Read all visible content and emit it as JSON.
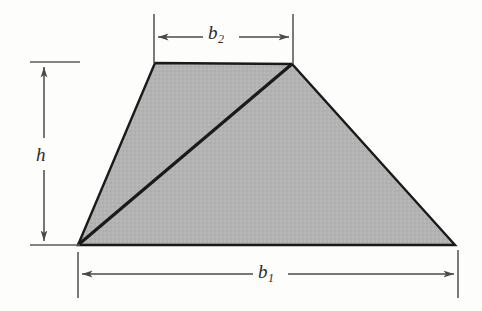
{
  "figure": {
    "kind": "geometry-diagram",
    "shape_name": "trapezoid",
    "background_color": "#fdfdfb",
    "fill_color": "#b3b3b3",
    "outline_color": "#1a1a1a",
    "dimension_line_color": "#4a4a4a"
  },
  "labels": {
    "top_base": {
      "symbol": "b",
      "subscript": "2",
      "text": "b2"
    },
    "bottom_base": {
      "symbol": "b",
      "subscript": "1",
      "text": "b1"
    },
    "height": {
      "symbol": "h",
      "subscript": "",
      "text": "h"
    }
  },
  "geometry": {
    "vertices": {
      "bottom_left": [
        78,
        245
      ],
      "top_left": [
        155,
        63
      ],
      "top_right": [
        292,
        64
      ],
      "bottom_right": [
        455,
        245
      ]
    },
    "diagonal": {
      "from": [
        78,
        245
      ],
      "to": [
        292,
        64
      ]
    },
    "dimensions": {
      "b2": {
        "axis": "horizontal",
        "y": 37,
        "x_start": 154,
        "x_end": 293
      },
      "b1": {
        "axis": "horizontal",
        "y": 274,
        "x_start": 78,
        "x_end": 458
      },
      "h": {
        "axis": "vertical",
        "x": 44,
        "y_start": 63,
        "y_end": 245
      }
    }
  }
}
